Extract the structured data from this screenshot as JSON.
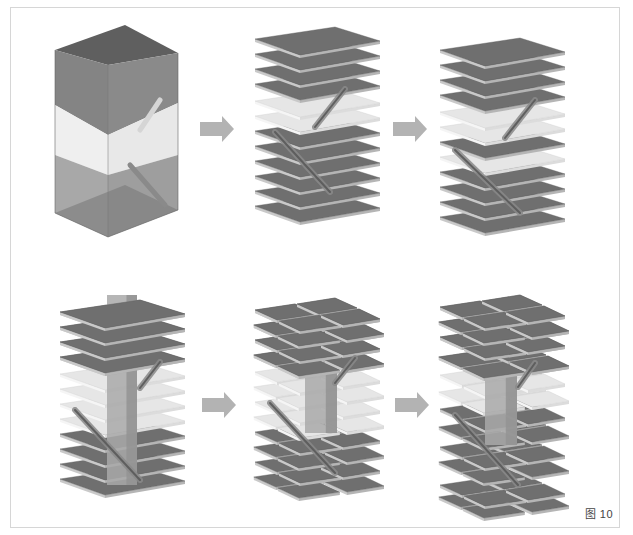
{
  "figure": {
    "caption": "图 10"
  },
  "colors": {
    "slab_top": "#6f6f6f",
    "slab_edge": "#c9c9c9",
    "slab_light_top": "#e6e6e6",
    "slab_light_edge": "#f5f5f5",
    "core": "#a9a9a9",
    "core_side": "#939393",
    "arrow": "#b3b3b3",
    "frame": "#d6d6d6",
    "volume_dark": "#7d7d7d",
    "volume_mid": "#efefef",
    "volume_low": "#a8a8a8"
  },
  "arrows": [
    {
      "id": "arrow-1",
      "x": 200,
      "y": 122
    },
    {
      "id": "arrow-2",
      "x": 393,
      "y": 122
    },
    {
      "id": "arrow-3",
      "x": 202,
      "y": 398
    },
    {
      "id": "arrow-4",
      "x": 395,
      "y": 398
    }
  ],
  "stages": [
    {
      "id": "stage-1-volume",
      "label": "building-volume",
      "x": 55,
      "y": 25,
      "type": "volume"
    },
    {
      "id": "stage-2-slabs",
      "label": "stacked-floor-slabs",
      "x": 255,
      "y": 27,
      "type": "slabs",
      "slabs": [
        {
          "y": 0,
          "light": false
        },
        {
          "y": 15,
          "light": false
        },
        {
          "y": 30,
          "light": false
        },
        {
          "y": 45,
          "light": false
        },
        {
          "y": 62,
          "light": true
        },
        {
          "y": 77,
          "light": true
        },
        {
          "y": 92,
          "light": false
        },
        {
          "y": 107,
          "light": false
        },
        {
          "y": 122,
          "light": false
        },
        {
          "y": 137,
          "light": false
        },
        {
          "y": 152,
          "light": false
        },
        {
          "y": 167,
          "light": false
        }
      ],
      "escalators": [
        {
          "x1": 90,
          "y1": 62,
          "x2": 60,
          "y2": 100
        },
        {
          "x1": 20,
          "y1": 105,
          "x2": 75,
          "y2": 165
        }
      ]
    },
    {
      "id": "stage-3-slabs",
      "label": "slabs-adjusted",
      "x": 440,
      "y": 38,
      "type": "slabs",
      "slabs": [
        {
          "y": 0,
          "light": false
        },
        {
          "y": 15,
          "light": false
        },
        {
          "y": 30,
          "light": false
        },
        {
          "y": 45,
          "light": false
        },
        {
          "y": 62,
          "light": true
        },
        {
          "y": 77,
          "light": true
        },
        {
          "y": 92,
          "light": false
        },
        {
          "y": 107,
          "light": true
        },
        {
          "y": 122,
          "light": false
        },
        {
          "y": 137,
          "light": false
        },
        {
          "y": 152,
          "light": false
        },
        {
          "y": 167,
          "light": false
        }
      ],
      "escalators": [
        {
          "x1": 95,
          "y1": 62,
          "x2": 65,
          "y2": 100
        },
        {
          "x1": 15,
          "y1": 112,
          "x2": 80,
          "y2": 175
        }
      ]
    },
    {
      "id": "stage-4-core",
      "label": "atrium-core-inserted",
      "x": 60,
      "y": 300,
      "type": "slabs_core",
      "slabs": [
        {
          "y": 0,
          "light": false
        },
        {
          "y": 15,
          "light": false
        },
        {
          "y": 30,
          "light": false
        },
        {
          "y": 45,
          "light": false
        },
        {
          "y": 62,
          "light": true
        },
        {
          "y": 77,
          "light": true
        },
        {
          "y": 92,
          "light": true
        },
        {
          "y": 107,
          "light": true
        },
        {
          "y": 122,
          "light": false
        },
        {
          "y": 137,
          "light": false
        },
        {
          "y": 152,
          "light": false
        },
        {
          "y": 167,
          "light": false
        }
      ],
      "core": {
        "x": 47,
        "w": 30,
        "top": -5,
        "bottom": 185
      },
      "escalators": [
        {
          "x1": 100,
          "y1": 62,
          "x2": 80,
          "y2": 88
        },
        {
          "x1": 15,
          "y1": 110,
          "x2": 80,
          "y2": 180
        }
      ]
    },
    {
      "id": "stage-5-split",
      "label": "slabs-split-around-core",
      "x": 255,
      "y": 298,
      "type": "slabs_split",
      "slabs": [
        {
          "y": 0,
          "light": false
        },
        {
          "y": 15,
          "light": false
        },
        {
          "y": 30,
          "light": false
        },
        {
          "y": 45,
          "light": false
        },
        {
          "y": 62,
          "light": true
        },
        {
          "y": 77,
          "light": true
        },
        {
          "y": 92,
          "light": true
        },
        {
          "y": 107,
          "light": true
        },
        {
          "y": 122,
          "light": false
        },
        {
          "y": 137,
          "light": false
        },
        {
          "y": 152,
          "light": false
        },
        {
          "y": 167,
          "light": false
        }
      ],
      "core": {
        "x": 50,
        "w": 32,
        "top": 15,
        "bottom": 135
      },
      "escalators": [
        {
          "x1": 100,
          "y1": 60,
          "x2": 80,
          "y2": 85
        },
        {
          "x1": 15,
          "y1": 105,
          "x2": 80,
          "y2": 175
        }
      ]
    },
    {
      "id": "stage-6-shifted",
      "label": "slabs-shifted-staggered",
      "x": 440,
      "y": 295,
      "type": "slabs_split",
      "slabs": [
        {
          "y": 0,
          "light": false
        },
        {
          "y": 15,
          "light": false
        },
        {
          "y": 30,
          "light": false
        },
        {
          "y": 50,
          "light": false
        },
        {
          "y": 68,
          "light": true
        },
        {
          "y": 85,
          "light": true
        },
        {
          "y": 102,
          "light": false
        },
        {
          "y": 120,
          "light": false
        },
        {
          "y": 140,
          "light": false
        },
        {
          "y": 155,
          "light": false
        },
        {
          "y": 178,
          "light": false
        },
        {
          "y": 190,
          "light": false
        }
      ],
      "core": {
        "x": 45,
        "w": 32,
        "top": 20,
        "bottom": 150
      },
      "escalators": [
        {
          "x1": 95,
          "y1": 68,
          "x2": 78,
          "y2": 92
        },
        {
          "x1": 15,
          "y1": 120,
          "x2": 78,
          "y2": 190
        }
      ]
    }
  ]
}
